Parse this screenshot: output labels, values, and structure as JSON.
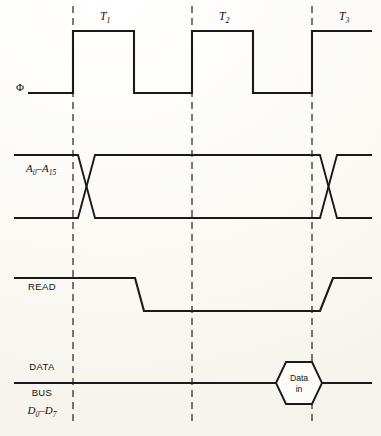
{
  "figure": {
    "type": "timing-diagram",
    "background_color": "#fdfcf8",
    "line_color": "#1a1a1a"
  },
  "cycles": [
    {
      "id": "T1",
      "base": "T",
      "sub": "1",
      "label_x": 100,
      "label_y": 20
    },
    {
      "id": "T2",
      "base": "T",
      "sub": "2",
      "label_x": 219,
      "label_y": 20
    },
    {
      "id": "T3",
      "base": "T",
      "sub": "3",
      "label_x": 339,
      "label_y": 20
    }
  ],
  "boundaries": [
    {
      "name": "t1-start",
      "x": 73,
      "y_top": 6,
      "y_bottom": 425
    },
    {
      "name": "t2-start",
      "x": 192,
      "y_top": 6,
      "y_bottom": 425
    },
    {
      "name": "t3-start",
      "x": 312,
      "y_top": 6,
      "y_bottom": 425
    }
  ],
  "signals": [
    {
      "name": "clock",
      "label": "Φ",
      "label_x": 20,
      "label_y": 91,
      "kind": "square-wave",
      "high_y": 31,
      "low_y": 93,
      "path": "M 28 93 L 73 93 L 73 31 L 134 31 L 134 93 L 192 93 L 192 31 L 253 31 L 253 93 L 312 93 L 312 31 L 372 31"
    },
    {
      "name": "address-bus",
      "label_base": "A",
      "label_sub1": "0",
      "label_dash": "–",
      "label_base2": "A",
      "label_sub2": "15",
      "label_x": 26,
      "label_y": 172,
      "kind": "bus-with-crossover",
      "high_y": 155,
      "low_y": 218,
      "path_top": "M 14 155 L 78 155 L 95 218 L 320 218 L 337 155 L 372 155",
      "path_bottom": "M 14 218 L 78 218 L 95 155 L 320 155 L 337 218 L 372 218"
    },
    {
      "name": "read",
      "label": "READ",
      "label_x": 28,
      "label_y": 290,
      "kind": "active-low-strobe",
      "high_y": 278,
      "low_y": 311,
      "path": "M 14 278 L 135 278 L 144 311 L 320 311 L 333 278 L 372 278"
    },
    {
      "name": "data-bus",
      "label_line1": "DATA",
      "label_line2": "BUS",
      "label_base": "D",
      "label_sub1": "0",
      "label_dash": "–",
      "label_base2": "D",
      "label_sub2": "7",
      "label1_x": 42,
      "label1_y": 370,
      "label2_x": 42,
      "label2_y": 396,
      "label3_x": 42,
      "label3_y": 414,
      "kind": "bus-with-valid-data",
      "center_y": 383,
      "path_left": "M 14 383 L 276 383",
      "path_right": "M 322 383 L 372 383",
      "valid_data": {
        "name": "data-in-symbol",
        "text_line1": "Data",
        "text_line2": "in",
        "center_x": 299,
        "text1_y": 381,
        "text2_y": 392,
        "path": "M 276 383 L 286 362 L 312 362 L 322 383 L 312 404 L 286 404 Z"
      }
    }
  ]
}
